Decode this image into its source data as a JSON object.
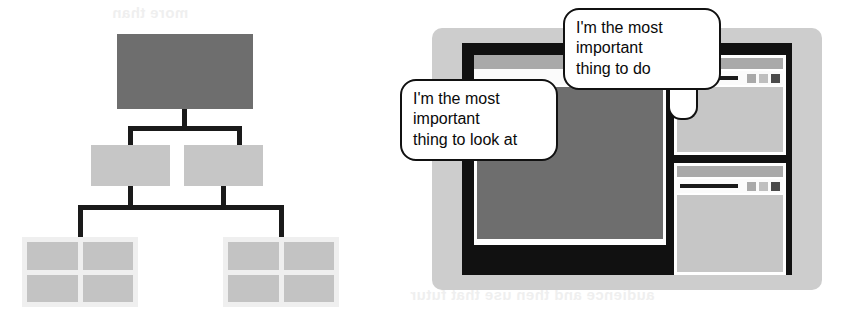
{
  "canvas": {
    "width": 856,
    "height": 319,
    "background": "#ffffff"
  },
  "ghost_text": {
    "top": "more than",
    "bottom": "audience and then use that futur"
  },
  "hierarchy": {
    "name": "visual-hierarchy-diagram",
    "colors": {
      "top_node": "#6e6e6e",
      "mid_node": "#c6c6c6",
      "leaf_container": "#efefef",
      "leaf_box": "#c3c3c3",
      "connector": "#1a1a1a"
    },
    "top_node": {
      "label": ""
    },
    "mid_nodes": [
      {
        "label": ""
      },
      {
        "label": ""
      }
    ],
    "leaf_groups": [
      {
        "boxes": [
          {
            "label": ""
          },
          {
            "label": ""
          },
          {
            "label": ""
          },
          {
            "label": ""
          }
        ]
      },
      {
        "boxes": [
          {
            "label": ""
          },
          {
            "label": ""
          },
          {
            "label": ""
          },
          {
            "label": ""
          }
        ]
      }
    ]
  },
  "scene": {
    "name": "screen-illustration",
    "monitor": {
      "frame_color": "#cdcdcd",
      "bezel_color": "#111111"
    },
    "main_window": {
      "name": "main-window",
      "titlebar_color": "#a9a9a9",
      "toolbar_color": "#fbfbfb",
      "canvas_color": "#6e6e6e",
      "buttons": [
        {
          "name": "toolbar-button-1",
          "color": "#a9a9a9"
        },
        {
          "name": "toolbar-button-2",
          "color": "#bfbfbf"
        },
        {
          "name": "toolbar-button-3",
          "color": "#4a4a4a"
        }
      ]
    },
    "side_windows": [
      {
        "name": "side-window-top",
        "titlebar_color": "#a9a9a9",
        "toolbar_color": "#fbfbfb",
        "body_color": "#c6c6c6",
        "buttons": [
          {
            "name": "toolbar-button-1",
            "color": "#a9a9a9"
          },
          {
            "name": "toolbar-button-2",
            "color": "#bfbfbf"
          },
          {
            "name": "toolbar-button-3",
            "color": "#4a4a4a"
          }
        ]
      },
      {
        "name": "side-window-bottom",
        "titlebar_color": "#a9a9a9",
        "toolbar_color": "#fbfbfb",
        "body_color": "#c6c6c6",
        "buttons": [
          {
            "name": "toolbar-button-1",
            "color": "#a9a9a9"
          },
          {
            "name": "toolbar-button-2",
            "color": "#bfbfbf"
          },
          {
            "name": "toolbar-button-3",
            "color": "#4a4a4a"
          }
        ]
      }
    ],
    "bubbles": [
      {
        "name": "speech-bubble-look-at",
        "text": "I'm the most\nimportant\nthing to look at",
        "points_to": "main-window"
      },
      {
        "name": "speech-bubble-to-do",
        "text": "I'm the most\nimportant\nthing to do",
        "points_to": "main-window-toolbar"
      }
    ]
  }
}
